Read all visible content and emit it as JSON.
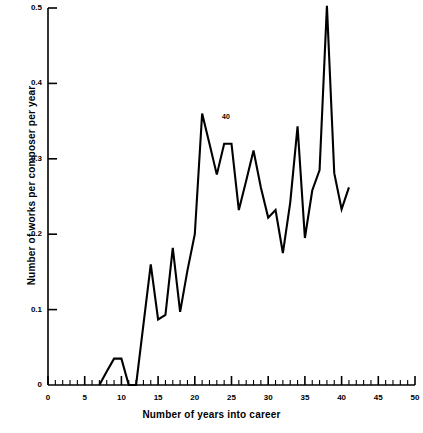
{
  "chart_data": {
    "type": "line",
    "title": "",
    "xlabel": "Number of years into career",
    "ylabel": "Number of works per composer per year",
    "xlim": [
      0,
      50
    ],
    "ylim": [
      0,
      0.5
    ],
    "grid": false,
    "legend": "none",
    "x_major_ticks": [
      0,
      5,
      10,
      15,
      20,
      25,
      30,
      35,
      40,
      45,
      50
    ],
    "x_major_tick_labels": [
      "0",
      "5",
      "10",
      "15",
      "20",
      "25",
      "30",
      "35",
      "40",
      "45",
      "50"
    ],
    "x_minor_tick_step": 1,
    "y_major_ticks": [
      0,
      0.1,
      0.2,
      0.3,
      0.4,
      0.5
    ],
    "y_major_tick_labels": [
      "0",
      "0.1",
      "0.2",
      "0.3",
      "0.4",
      "0.5"
    ],
    "annotations": [
      {
        "text": "40",
        "x": 24.4,
        "y": 0.355
      }
    ],
    "series": [
      {
        "name": "works per composer per year",
        "x": [
          7,
          8,
          9,
          10,
          11,
          12,
          13,
          14,
          15,
          16,
          17,
          18,
          19,
          20,
          21,
          22,
          23,
          24,
          25,
          26,
          27,
          28,
          29,
          30,
          31,
          32,
          33,
          34,
          35,
          36,
          37,
          38,
          39,
          40,
          41
        ],
        "y": [
          0.0,
          0.018,
          0.035,
          0.035,
          0.0,
          0.0,
          0.08,
          0.16,
          0.087,
          0.093,
          0.182,
          0.097,
          0.152,
          0.2,
          0.36,
          0.32,
          0.279,
          0.32,
          0.32,
          0.232,
          0.271,
          0.311,
          0.262,
          0.222,
          0.232,
          0.175,
          0.242,
          0.343,
          0.195,
          0.258,
          0.285,
          0.503,
          0.281,
          0.233,
          0.262
        ]
      }
    ]
  },
  "axis": {
    "x_title": "Number of years into career",
    "y_title": "Number of works per composer per year"
  }
}
